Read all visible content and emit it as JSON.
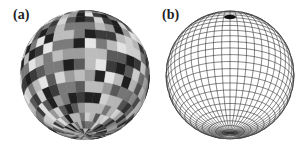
{
  "figure": {
    "panels": [
      {
        "id": "a",
        "label": "(a)",
        "description": "Sphere surface tiled with a latitude-longitude mesh of randomly shaded grayscale patches",
        "center": [
          85,
          75
        ],
        "radius": 65,
        "tilt_deg": 25,
        "lat_bands": 18,
        "lon_sectors": 36,
        "shades": [
          "#1e1e1e",
          "#3a3a3a",
          "#5a5a5a",
          "#7a7a7a",
          "#9c9c9c",
          "#bdbdbd",
          "#d6d6d6",
          "#e8e8e8"
        ]
      },
      {
        "id": "b",
        "label": "(b)",
        "description": "Wireframe sphere showing a latitude-longitude grid with dense convergence at the north pole",
        "center": [
          78,
          75
        ],
        "radius": 64,
        "tilt_deg": 25,
        "lat_lines": 28,
        "lon_lines": 48,
        "line_color": "#333333"
      }
    ]
  }
}
